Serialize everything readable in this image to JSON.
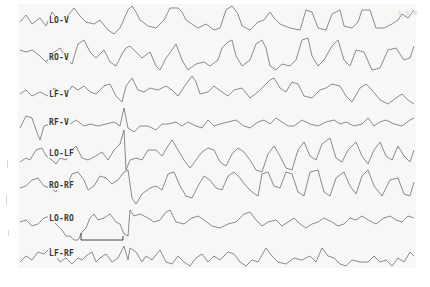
{
  "figure": {
    "type": "eeg-tracing",
    "trace_color": "#6e6e6e",
    "paper_color": "#f7f7f5",
    "corner_mark": "5 5 8"
  },
  "channels": [
    {
      "label": "LO-V",
      "y": 20
    },
    {
      "label": "RO-V",
      "y": 57
    },
    {
      "label": "LF-V",
      "y": 94
    },
    {
      "label": "RF-V",
      "y": 122
    },
    {
      "label": "LO-LF",
      "y": 153
    },
    {
      "label": "RO-RF",
      "y": 185
    },
    {
      "label": "LO-RO",
      "y": 218
    },
    {
      "label": "LF-RF",
      "y": 253
    }
  ],
  "calibration": {
    "x_start": 81,
    "x_end": 123,
    "y_top": 233,
    "y_base": 240
  }
}
